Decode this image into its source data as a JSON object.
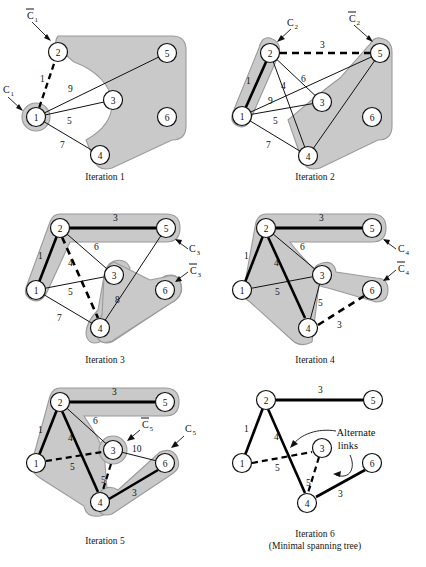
{
  "figure": {
    "node_labels": [
      "1",
      "2",
      "3",
      "4",
      "5",
      "6"
    ],
    "colors": {
      "shade_fill": "#c9c9c9",
      "shade_stroke": "#9a9a9a",
      "node_fill": "#ffffff",
      "node_stroke": "#111111",
      "thin_link": "#111111",
      "thick_link": "#000000",
      "dashed_link": "#000000",
      "text": "#111111",
      "page_bg": "#ffffff"
    }
  },
  "panels": [
    {
      "id": "iteration-1",
      "caption": "Iteration 1",
      "annotations": [
        {
          "name": "c1-bar-label",
          "text": "C̅1"
        },
        {
          "name": "c1-label",
          "text": "C₁"
        }
      ],
      "edge_labels": [
        {
          "name": "edge-label-1-2",
          "text": "1"
        },
        {
          "name": "edge-label-1-3",
          "text": "9"
        },
        {
          "name": "edge-label-1-3b",
          "text": "5"
        },
        {
          "name": "edge-label-1-4",
          "text": "7"
        }
      ]
    },
    {
      "id": "iteration-2",
      "caption": "Iteration 2",
      "annotations": [
        {
          "name": "c2-label",
          "text": "C₂"
        },
        {
          "name": "c2-bar-label",
          "text": "C̅2"
        }
      ],
      "edge_labels": [
        {
          "name": "edge-label-2-5",
          "text": "3"
        },
        {
          "name": "edge-label-1-2",
          "text": "1"
        },
        {
          "name": "edge-label-2-4",
          "text": "4"
        },
        {
          "name": "edge-label-2-3",
          "text": "6"
        },
        {
          "name": "edge-label-1-5",
          "text": "9"
        },
        {
          "name": "edge-label-1-3",
          "text": "5"
        },
        {
          "name": "edge-label-1-4",
          "text": "7"
        }
      ]
    },
    {
      "id": "iteration-3",
      "caption": "Iteration 3",
      "annotations": [
        {
          "name": "c3-label",
          "text": "C₃"
        },
        {
          "name": "c3-bar-label",
          "text": "C̅3"
        }
      ],
      "edge_labels": [
        {
          "name": "edge-label-2-5",
          "text": "3"
        },
        {
          "name": "edge-label-1-2",
          "text": "1"
        },
        {
          "name": "edge-label-2-3",
          "text": "6"
        },
        {
          "name": "edge-label-2-4",
          "text": "4"
        },
        {
          "name": "edge-label-1-3",
          "text": "5"
        },
        {
          "name": "edge-label-4-6",
          "text": "8"
        },
        {
          "name": "edge-label-1-4",
          "text": "7"
        }
      ]
    },
    {
      "id": "iteration-4",
      "caption": "Iteration 4",
      "annotations": [
        {
          "name": "c4-label",
          "text": "C₄"
        },
        {
          "name": "c4-bar-label",
          "text": "C̅4"
        }
      ],
      "edge_labels": [
        {
          "name": "edge-label-2-5",
          "text": "3"
        },
        {
          "name": "edge-label-1-2",
          "text": "1"
        },
        {
          "name": "edge-label-2-3",
          "text": "6"
        },
        {
          "name": "edge-label-2-4",
          "text": "4"
        },
        {
          "name": "edge-label-1-3",
          "text": "5"
        },
        {
          "name": "edge-label-3-4",
          "text": "5"
        },
        {
          "name": "edge-label-4-6",
          "text": "3"
        }
      ]
    },
    {
      "id": "iteration-5",
      "caption": "Iteration 5",
      "annotations": [
        {
          "name": "c5-bar-label",
          "text": "C̅5"
        },
        {
          "name": "c5-label",
          "text": "C₅"
        }
      ],
      "edge_labels": [
        {
          "name": "edge-label-2-5",
          "text": "3"
        },
        {
          "name": "edge-label-1-2",
          "text": "1"
        },
        {
          "name": "edge-label-2-3",
          "text": "6"
        },
        {
          "name": "edge-label-2-4",
          "text": "4"
        },
        {
          "name": "edge-label-1-3",
          "text": "5"
        },
        {
          "name": "edge-label-3-6",
          "text": "10"
        },
        {
          "name": "edge-label-3-4",
          "text": "5"
        },
        {
          "name": "edge-label-4-6",
          "text": "3"
        }
      ]
    },
    {
      "id": "iteration-6",
      "caption": "Iteration 6",
      "caption2": "(Minimal spanning tree)",
      "annotations": [
        {
          "name": "alternate-links-label-line1",
          "text": "Alternate"
        },
        {
          "name": "alternate-links-label-line2",
          "text": "links"
        }
      ],
      "edge_labels": [
        {
          "name": "edge-label-2-5",
          "text": "3"
        },
        {
          "name": "edge-label-1-2",
          "text": "1"
        },
        {
          "name": "edge-label-2-4",
          "text": "4"
        },
        {
          "name": "edge-label-1-3",
          "text": "5"
        },
        {
          "name": "edge-label-3-4",
          "text": "5"
        },
        {
          "name": "edge-label-4-6",
          "text": "3"
        }
      ]
    }
  ]
}
